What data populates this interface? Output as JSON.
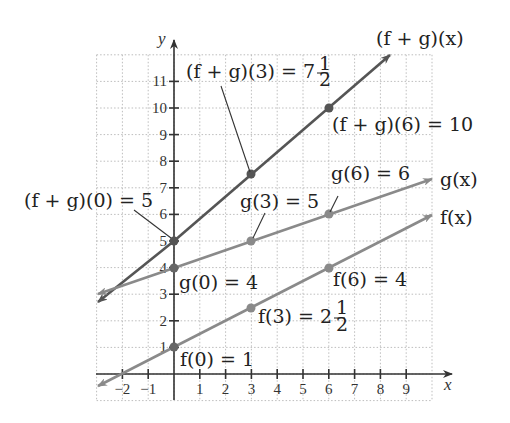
{
  "chart_data": {
    "type": "line",
    "title": "",
    "xlabel": "x",
    "ylabel": "y",
    "xlim": [
      -3,
      10
    ],
    "ylim": [
      -1,
      12
    ],
    "grid": true,
    "x_ticks": [
      -2,
      -1,
      1,
      2,
      3,
      4,
      5,
      6,
      7,
      8,
      9
    ],
    "y_ticks": [
      1,
      2,
      3,
      4,
      5,
      6,
      7,
      8,
      9,
      10,
      11
    ],
    "series": [
      {
        "name": "(f + g)(x)",
        "equation": "(f+g)(x) = 5x/6 + 5",
        "color": "#555555",
        "x": [
          -3,
          0,
          3,
          6,
          8.6
        ],
        "y": [
          2.5,
          5,
          7.5,
          10,
          12.2
        ],
        "marked_points": [
          [
            0,
            5
          ],
          [
            3,
            7.5
          ],
          [
            6,
            10
          ]
        ]
      },
      {
        "name": "g(x)",
        "equation": "g(x) = x/3 + 4",
        "color": "#8a8a8a",
        "x": [
          -3,
          0,
          3,
          6,
          10
        ],
        "y": [
          3,
          4,
          5,
          6,
          7.33
        ],
        "marked_points": [
          [
            0,
            4
          ],
          [
            3,
            5
          ],
          [
            6,
            6
          ]
        ]
      },
      {
        "name": "f(x)",
        "equation": "f(x) = x/2 + 1",
        "color": "#8a8a8a",
        "x": [
          -3,
          0,
          3,
          6,
          10
        ],
        "y": [
          -0.5,
          1,
          2.5,
          4,
          6
        ],
        "marked_points": [
          [
            0,
            1
          ],
          [
            3,
            2.5
          ],
          [
            6,
            4
          ]
        ]
      }
    ],
    "annotations": [
      "(f + g)(3) = 7 1/2",
      "(f + g)(6) = 10",
      "(f + g)(0) = 5",
      "g(6) = 6",
      "g(3) = 5",
      "g(0) = 4",
      "f(6) = 4",
      "f(3) = 2 1/2",
      "f(0) = 1"
    ],
    "legend_position": "inline labels at line ends"
  },
  "labels": {
    "axis_x": "x",
    "axis_y": "y",
    "fg_line": "(f + g)(x)",
    "g_line": "g(x)",
    "f_line": "f(x)",
    "fg3_main": "(f + g)(3) = 7",
    "fg3_num": "1",
    "fg3_den": "2",
    "fg6": "(f + g)(6) = 10",
    "fg0": "(f + g)(0) = 5",
    "g6": "g(6) = 6",
    "g3": "g(3) = 5",
    "g0": "g(0) = 4",
    "f6": "f(6) = 4",
    "f3_main": "f(3) = 2",
    "f3_num": "1",
    "f3_den": "2",
    "f0": "f(0) = 1"
  },
  "ticks": {
    "x": [
      "−2",
      "−1",
      "1",
      "2",
      "3",
      "4",
      "5",
      "6",
      "7",
      "8",
      "9"
    ],
    "y": [
      "1",
      "2",
      "3",
      "4",
      "5",
      "6",
      "7",
      "8",
      "9",
      "10",
      "11"
    ]
  }
}
